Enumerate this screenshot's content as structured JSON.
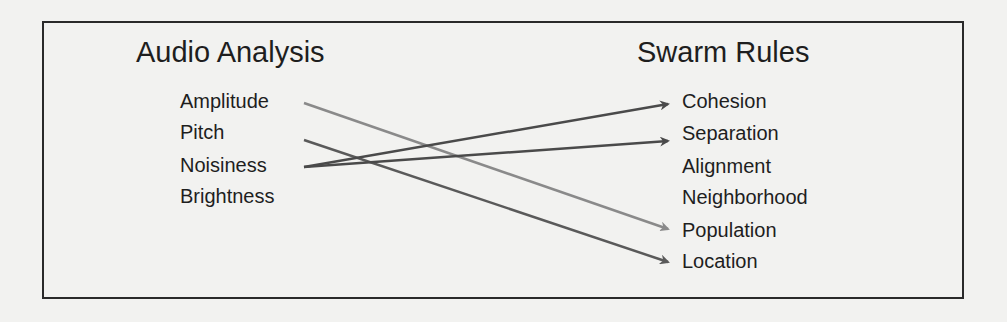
{
  "left": {
    "heading": "Audio Analysis",
    "items": [
      "Amplitude",
      "Pitch",
      "Noisiness",
      "Brightness"
    ]
  },
  "right": {
    "heading": "Swarm Rules",
    "items": [
      "Cohesion",
      "Separation",
      "Alignment",
      "Neighborhood",
      "Population",
      "Location"
    ]
  },
  "mappings": [
    {
      "from": "Amplitude",
      "to": "Population",
      "color": "#8a8a8a"
    },
    {
      "from": "Pitch",
      "to": "Location",
      "color": "#5a5a5a"
    },
    {
      "from": "Noisiness",
      "to": "Cohesion",
      "color": "#4a4a4a"
    },
    {
      "from": "Noisiness",
      "to": "Separation",
      "color": "#4a4a4a"
    }
  ]
}
